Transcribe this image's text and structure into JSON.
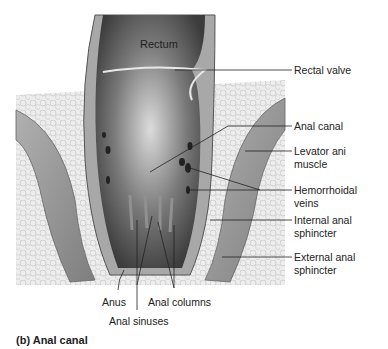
{
  "figure": {
    "caption": "(b) Anal canal",
    "title_label": "Rectum",
    "labels": [
      {
        "id": "rectal-valve",
        "text": "Rectal valve"
      },
      {
        "id": "anal-canal",
        "text": "Anal canal"
      },
      {
        "id": "levator-ani",
        "text": "Levator ani\nmuscle"
      },
      {
        "id": "hemorrhoidal-veins",
        "text": "Hemorrhoidal\nveins"
      },
      {
        "id": "internal-sphincter",
        "text": "Internal anal\nsphincter"
      },
      {
        "id": "external-sphincter",
        "text": "External anal\nsphincter"
      },
      {
        "id": "anus",
        "text": "Anus"
      },
      {
        "id": "anal-columns",
        "text": "Anal columns"
      },
      {
        "id": "anal-sinuses",
        "text": "Anal sinuses"
      }
    ]
  },
  "colors": {
    "background": "#ffffff",
    "tissue_light": "#e4e4e4",
    "tissue_mid": "#9a9a9a",
    "lumen_dark": "#4a4a4a",
    "leader_line": "#222222"
  }
}
